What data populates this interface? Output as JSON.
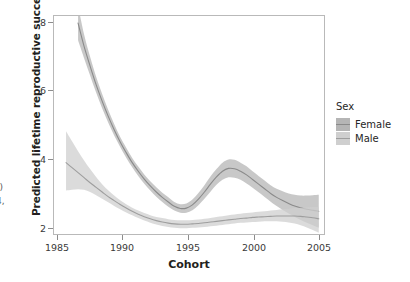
{
  "figure": {
    "edge_fragments": [
      "))",
      "4,"
    ]
  },
  "legend": {
    "title": "Sex",
    "entries": [
      {
        "label": "Female",
        "ribbon_color": "#b5b5b5",
        "line_color": "#8a8a8a"
      },
      {
        "label": "Male",
        "ribbon_color": "#cfcfcf",
        "line_color": "#9e9e9e"
      }
    ]
  },
  "axes": {
    "x_title": "Cohort",
    "y_title": "Predicted lifetime reproductive success",
    "x_ticks": [
      "1985",
      "1990",
      "1995",
      "2000",
      "2005"
    ],
    "y_ticks": [
      "2",
      "4",
      "6",
      "8"
    ],
    "panel_border_color": "#b9b9b9",
    "panel_background": "#ffffff"
  },
  "chart_data": {
    "type": "line",
    "title": "",
    "subtitle": "",
    "xlabel": "Cohort",
    "ylabel": "Predicted lifetime reproductive success",
    "xlim": [
      1985,
      2007.6
    ],
    "ylim": [
      1.95,
      8.1
    ],
    "x_ticks": [
      1985,
      1990,
      1995,
      2000,
      2005
    ],
    "y_ticks": [
      2,
      4,
      6,
      8
    ],
    "grid": false,
    "legend_position": "right",
    "legend_title": "Sex",
    "shaded_bands": "95% confidence ribbon around each smoothed fit",
    "series": [
      {
        "name": "Female",
        "color": "#8a8a8a",
        "ribbon_color": "#b5b5b5",
        "x": [
          1987.0,
          1987.5,
          1988.0,
          1988.5,
          1989.0,
          1989.5,
          1990.0,
          1990.5,
          1991.0,
          1991.5,
          1992.0,
          1992.5,
          1993.0,
          1993.5,
          1994.0,
          1994.5,
          1995.0,
          1995.5,
          1996.0,
          1996.5,
          1997.0,
          1997.5,
          1998.0,
          1998.5,
          1999.0,
          1999.5,
          2000.0,
          2000.5,
          2001.0,
          2001.5,
          2002.0,
          2002.5,
          2003.0,
          2003.5,
          2004.0,
          2004.5,
          2005.0,
          2005.5,
          2006.0,
          2006.5,
          2007.0
        ],
        "y": [
          7.9,
          7.25,
          6.7,
          6.18,
          5.72,
          5.3,
          4.92,
          4.58,
          4.28,
          4.0,
          3.76,
          3.54,
          3.35,
          3.18,
          3.03,
          2.9,
          2.78,
          2.72,
          2.73,
          2.82,
          2.98,
          3.18,
          3.4,
          3.6,
          3.76,
          3.84,
          3.83,
          3.76,
          3.66,
          3.53,
          3.4,
          3.27,
          3.14,
          3.03,
          2.94,
          2.86,
          2.79,
          2.74,
          2.7,
          2.67,
          2.64
        ],
        "y_lower": [
          7.42,
          6.92,
          6.44,
          5.96,
          5.52,
          5.12,
          4.76,
          4.44,
          4.14,
          3.87,
          3.63,
          3.41,
          3.22,
          3.05,
          2.9,
          2.77,
          2.66,
          2.6,
          2.6,
          2.67,
          2.81,
          2.99,
          3.19,
          3.38,
          3.52,
          3.59,
          3.58,
          3.52,
          3.42,
          3.3,
          3.17,
          3.04,
          2.91,
          2.79,
          2.68,
          2.58,
          2.48,
          2.4,
          2.32,
          2.25,
          2.18
        ],
        "y_upper": [
          8.38,
          7.58,
          6.96,
          6.4,
          5.92,
          5.48,
          5.08,
          4.72,
          4.42,
          4.13,
          3.89,
          3.67,
          3.48,
          3.31,
          3.16,
          3.03,
          2.9,
          2.84,
          2.86,
          2.97,
          3.15,
          3.37,
          3.61,
          3.82,
          4.0,
          4.09,
          4.08,
          4.0,
          3.9,
          3.76,
          3.63,
          3.5,
          3.37,
          3.27,
          3.2,
          3.14,
          3.1,
          3.08,
          3.08,
          3.09,
          3.1
        ]
      },
      {
        "name": "Male",
        "color": "#9e9e9e",
        "ribbon_color": "#cfcfcf",
        "x": [
          1986.0,
          1986.5,
          1987.0,
          1987.5,
          1988.0,
          1988.5,
          1989.0,
          1989.5,
          1990.0,
          1990.5,
          1991.0,
          1991.5,
          1992.0,
          1992.5,
          1993.0,
          1993.5,
          1994.0,
          1994.5,
          1995.0,
          1995.5,
          1996.0,
          1996.5,
          1997.0,
          1997.5,
          1998.0,
          1998.5,
          1999.0,
          1999.5,
          2000.0,
          2000.5,
          2001.0,
          2001.5,
          2002.0,
          2002.5,
          2003.0,
          2003.5,
          2004.0,
          2004.5,
          2005.0,
          2005.5,
          2006.0,
          2006.5,
          2007.0
        ],
        "y": [
          4.0,
          3.86,
          3.72,
          3.58,
          3.44,
          3.31,
          3.18,
          3.05,
          2.94,
          2.83,
          2.73,
          2.64,
          2.56,
          2.49,
          2.43,
          2.38,
          2.34,
          2.31,
          2.29,
          2.28,
          2.28,
          2.29,
          2.3,
          2.32,
          2.34,
          2.36,
          2.38,
          2.4,
          2.42,
          2.44,
          2.45,
          2.47,
          2.48,
          2.49,
          2.5,
          2.51,
          2.51,
          2.51,
          2.51,
          2.5,
          2.48,
          2.46,
          2.43
        ],
        "y_lower": [
          3.22,
          3.24,
          3.26,
          3.24,
          3.18,
          3.09,
          2.99,
          2.89,
          2.79,
          2.7,
          2.61,
          2.53,
          2.45,
          2.38,
          2.32,
          2.27,
          2.23,
          2.2,
          2.18,
          2.17,
          2.17,
          2.18,
          2.19,
          2.2,
          2.22,
          2.24,
          2.26,
          2.28,
          2.3,
          2.32,
          2.33,
          2.34,
          2.35,
          2.36,
          2.36,
          2.36,
          2.35,
          2.33,
          2.3,
          2.25,
          2.19,
          2.12,
          2.04
        ],
        "y_upper": [
          4.88,
          4.6,
          4.32,
          4.06,
          3.82,
          3.6,
          3.4,
          3.23,
          3.08,
          2.95,
          2.84,
          2.74,
          2.66,
          2.59,
          2.53,
          2.48,
          2.45,
          2.42,
          2.4,
          2.39,
          2.39,
          2.4,
          2.41,
          2.43,
          2.45,
          2.48,
          2.5,
          2.53,
          2.55,
          2.57,
          2.59,
          2.61,
          2.63,
          2.64,
          2.66,
          2.68,
          2.7,
          2.71,
          2.73,
          2.74,
          2.75,
          2.76,
          2.77
        ]
      }
    ]
  }
}
